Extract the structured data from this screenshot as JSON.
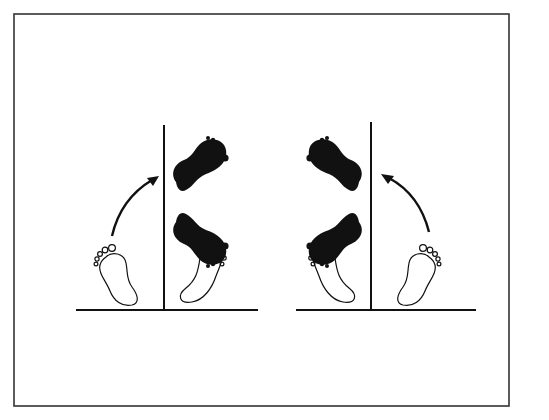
{
  "figure": {
    "colors": {
      "background": "#ffffff",
      "ink": "#111111",
      "frame": "#333333"
    },
    "panels": [
      {
        "id": "left-panel",
        "wall_side": "right-of-start",
        "arrow_direction": "up-right",
        "elements": [
          "outline-start-foot",
          "curved-arrow",
          "black-foot-upper",
          "black-foot-lower",
          "outline-foot-lower",
          "wall-line",
          "floor-line"
        ]
      },
      {
        "id": "right-panel",
        "wall_side": "left-of-start",
        "arrow_direction": "up-left",
        "elements": [
          "outline-start-foot",
          "curved-arrow",
          "black-foot-upper",
          "black-foot-lower",
          "outline-foot-lower",
          "wall-line",
          "floor-line"
        ]
      }
    ]
  }
}
